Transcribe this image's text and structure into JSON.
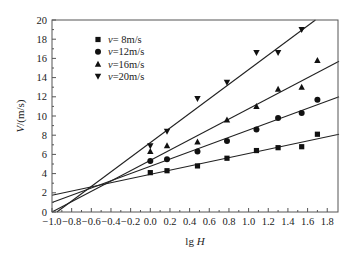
{
  "chart_data": {
    "type": "scatter",
    "title": "",
    "xlabel": "lg H",
    "ylabel": "V/(m/s)",
    "xlim": [
      -1.0,
      1.92
    ],
    "ylim": [
      0,
      20.5
    ],
    "x_ticks": [
      -1.0,
      -0.8,
      -0.6,
      -0.4,
      -0.2,
      0.0,
      0.2,
      0.4,
      0.6,
      0.8,
      1.0,
      1.2,
      1.4,
      1.6,
      1.8
    ],
    "x_tick_labels": [
      "−1.0",
      "−0.8",
      "−0.6",
      "−0.4",
      "−0.2",
      "0.0",
      "0.2",
      "0.4",
      "0.6",
      "0.8",
      "1.0",
      "1.2",
      "1.4",
      "1.6",
      "1.8"
    ],
    "y_ticks": [
      0,
      2,
      4,
      6,
      8,
      10,
      12,
      14,
      16,
      18,
      20
    ],
    "y_tick_labels": [
      "0",
      "2",
      "4",
      "6",
      "8",
      "10",
      "12",
      "14",
      "16",
      "18",
      "20"
    ],
    "grid": false,
    "legend_position": "upper-left",
    "series": [
      {
        "name": "v= 8m/s",
        "marker": "square",
        "x": [
          0.0,
          0.17,
          0.48,
          0.78,
          1.08,
          1.3,
          1.54,
          1.7
        ],
        "y": [
          4.1,
          4.3,
          4.8,
          5.6,
          6.4,
          6.7,
          6.8,
          8.1
        ],
        "fit": {
          "x0": -1.0,
          "y0": 1.75,
          "x1": 1.92,
          "y1": 8.1
        }
      },
      {
        "name": "v=12m/s",
        "marker": "circle",
        "x": [
          0.0,
          0.17,
          0.48,
          0.78,
          1.08,
          1.3,
          1.54,
          1.7
        ],
        "y": [
          5.3,
          5.5,
          6.3,
          7.4,
          8.6,
          9.8,
          10.3,
          11.7
        ],
        "fit": {
          "x0": -1.0,
          "y0": 1.0,
          "x1": 1.92,
          "y1": 12.0
        }
      },
      {
        "name": "v=16m/s",
        "marker": "triangle-up",
        "x": [
          0.0,
          0.17,
          0.48,
          0.78,
          1.08,
          1.3,
          1.54,
          1.7
        ],
        "y": [
          6.3,
          6.9,
          7.3,
          9.6,
          11.0,
          12.8,
          13.0,
          15.8
        ],
        "fit": {
          "x0": -1.0,
          "y0": 0.0,
          "x1": 1.92,
          "y1": 15.7
        }
      },
      {
        "name": "v=20m/s",
        "marker": "triangle-down",
        "x": [
          0.0,
          0.17,
          0.48,
          0.78,
          1.08,
          1.3,
          1.54
        ],
        "y": [
          6.9,
          8.4,
          11.8,
          13.5,
          16.6,
          16.6,
          19.0
        ],
        "fit": {
          "x0": -0.95,
          "y0": 0.0,
          "x1": 1.68,
          "y1": 20.0
        }
      }
    ]
  },
  "colors": {
    "axis": "#555555",
    "marker": "#111111",
    "line": "#222222"
  }
}
